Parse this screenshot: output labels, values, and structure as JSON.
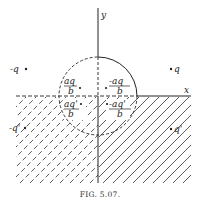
{
  "figure": {
    "caption": "FIG. 5.07.",
    "axes": {
      "x_label": "x",
      "y_label": "y"
    },
    "external_charges": [
      {
        "id": "neg-q",
        "label": "-q",
        "position": "upper-left"
      },
      {
        "id": "q",
        "label": "q",
        "position": "upper-right"
      },
      {
        "id": "neg-q-prime",
        "label": "-q'",
        "position": "lower-left"
      },
      {
        "id": "q-prime",
        "label": "q'",
        "position": "lower-right"
      }
    ],
    "image_charges": [
      {
        "id": "img-upper-left",
        "numerator": "aq",
        "denominator": "b",
        "sign": ""
      },
      {
        "id": "img-upper-right",
        "numerator": "-aq",
        "denominator": "b",
        "sign": "-"
      },
      {
        "id": "img-lower-left",
        "numerator": "aq'",
        "denominator": "b",
        "sign": ""
      },
      {
        "id": "img-lower-right",
        "numerator": "-aq'",
        "denominator": "b",
        "sign": "-"
      }
    ],
    "regions": {
      "lower_left": "dashed hatching",
      "lower_right": "solid hatching"
    },
    "colors": {
      "ink": "#222222",
      "background": "#ffffff"
    }
  }
}
